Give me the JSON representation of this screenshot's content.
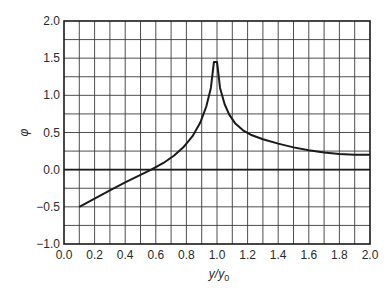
{
  "chart_data": {
    "type": "line",
    "title": "",
    "xlabel": "y/y0",
    "xlabel_parts": {
      "base": "y/y",
      "sub": "0"
    },
    "ylabel": "φ",
    "xlim": [
      0.0,
      2.0
    ],
    "ylim": [
      -1.0,
      2.0
    ],
    "grid": true,
    "x_grid_step": 0.1,
    "y_grid_step": 0.25,
    "x_ticks": [
      0.0,
      0.2,
      0.4,
      0.6,
      0.8,
      1.0,
      1.2,
      1.4,
      1.6,
      1.8,
      2.0
    ],
    "x_tick_labels": [
      "0.0",
      "0.2",
      "0.4",
      "0.6",
      "0.8",
      "1.0",
      "1.2",
      "1.4",
      "1.6",
      "1.8",
      "2.0"
    ],
    "y_ticks": [
      -1.0,
      -0.5,
      0.0,
      0.5,
      1.0,
      1.5,
      2.0
    ],
    "y_tick_labels": [
      "−1.0",
      "−0.5",
      "0.0",
      "0.5",
      "1.0",
      "1.5",
      "2.0"
    ],
    "reference_lines": [
      {
        "axis": "y",
        "value": 0.0
      }
    ],
    "series": [
      {
        "name": "phi",
        "x": [
          0.1,
          0.2,
          0.3,
          0.4,
          0.5,
          0.57,
          0.65,
          0.72,
          0.78,
          0.84,
          0.89,
          0.93,
          0.96,
          0.98,
          1.0,
          1.02,
          1.05,
          1.08,
          1.12,
          1.17,
          1.22,
          1.3,
          1.4,
          1.5,
          1.6,
          1.7,
          1.8,
          1.9,
          2.0
        ],
        "y": [
          -0.5,
          -0.39,
          -0.28,
          -0.17,
          -0.07,
          0.0,
          0.09,
          0.19,
          0.3,
          0.45,
          0.63,
          0.85,
          1.1,
          1.45,
          1.45,
          1.1,
          0.88,
          0.74,
          0.62,
          0.53,
          0.47,
          0.41,
          0.35,
          0.3,
          0.26,
          0.23,
          0.21,
          0.2,
          0.2
        ]
      }
    ]
  }
}
